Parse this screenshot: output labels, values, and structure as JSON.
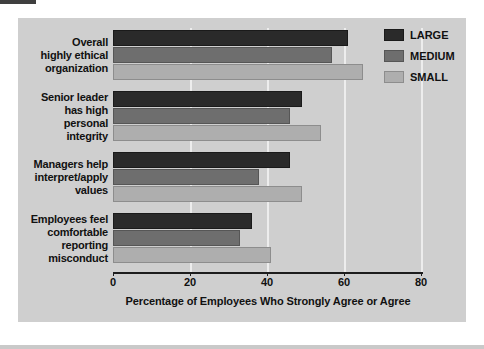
{
  "chart_data": {
    "type": "bar",
    "orientation": "horizontal",
    "title": "",
    "xlabel": "Percentage of Employees Who Strongly Agree or Agree",
    "ylabel": "",
    "xlim": [
      0,
      80
    ],
    "xticks": [
      0,
      20,
      40,
      60,
      80
    ],
    "xtick_labels": [
      "0",
      "20",
      "40",
      "60",
      "80"
    ],
    "grid": true,
    "grid_axis": "x",
    "legend_position": "top-right",
    "categories": [
      "Overall highly ethical organization",
      "Senior leader has high personal integrity",
      "Managers help interpret/apply values",
      "Employees feel comfortable reporting misconduct"
    ],
    "category_lines": [
      [
        "Overall",
        "highly ethical",
        "organization"
      ],
      [
        "Senior leader",
        "has high",
        "personal",
        "integrity"
      ],
      [
        "Managers help",
        "interpret/apply",
        "values"
      ],
      [
        "Employees feel",
        "comfortable",
        "reporting",
        "misconduct"
      ]
    ],
    "series": [
      {
        "name": "LARGE",
        "color": "#2a2a2a",
        "values": [
          61,
          49,
          46,
          36
        ]
      },
      {
        "name": "MEDIUM",
        "color": "#6e6e6e",
        "values": [
          57,
          46,
          38,
          33
        ]
      },
      {
        "name": "SMALL",
        "color": "#aeaeae",
        "values": [
          65,
          54,
          49,
          41
        ]
      }
    ]
  },
  "legend": {
    "items": [
      {
        "label": "LARGE",
        "swatch": "large"
      },
      {
        "label": "MEDIUM",
        "swatch": "medium"
      },
      {
        "label": "SMALL",
        "swatch": "small"
      }
    ]
  },
  "axis": {
    "x_title": "Percentage of Employees Who Strongly Agree or Agree"
  },
  "colors": {
    "panel_background": "#cfcfcf",
    "large": "#2a2a2a",
    "medium": "#6e6e6e",
    "small": "#aeaeae",
    "axis": "#1d1d1d",
    "gridline": "#f2f2f2"
  }
}
